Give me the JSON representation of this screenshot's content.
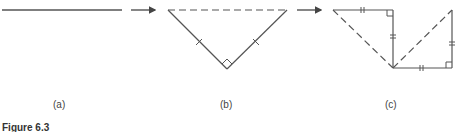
{
  "panels": [
    {
      "id": "a",
      "label": "(a)",
      "description": "straight line segment"
    },
    {
      "id": "b",
      "label": "(b)",
      "description": "line folded into right isosceles triangle with dashed hypotenuse"
    },
    {
      "id": "c",
      "label": "(c)",
      "description": "two right triangles with equal legs joined at a vertex, dashed hypotenuses"
    }
  ],
  "caption": "Figure 6.3",
  "colors": {
    "stroke": "#555555",
    "background": "#ffffff"
  }
}
